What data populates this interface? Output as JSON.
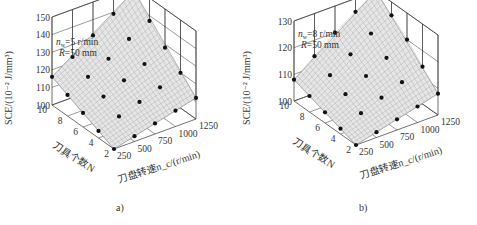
{
  "chart_data": [
    {
      "type": "surface3d",
      "panel_label": "a)",
      "zlabel": "SCE/(10⁻² J/mm³)",
      "xlabel": "刀盘转速n_c/(r/min)",
      "ylabel": "刀具个数N",
      "annotation": [
        "n_w=5 r/min",
        "R=50 mm"
      ],
      "x_ticks": [
        250,
        500,
        750,
        1000,
        1250
      ],
      "y_ticks": [
        2,
        4,
        6,
        8,
        10
      ],
      "z_ticks": [
        100,
        110,
        120,
        130,
        140,
        150
      ],
      "zlim": [
        100,
        150
      ],
      "grid": true,
      "x": [
        250,
        500,
        750,
        1000,
        1250
      ],
      "y": [
        2,
        4,
        6,
        8,
        10
      ],
      "z_surface": [
        [
          100,
          103,
          106,
          109,
          112
        ],
        [
          104,
          108,
          112,
          116,
          120
        ],
        [
          108,
          113,
          118,
          123,
          128
        ],
        [
          112,
          118,
          124,
          131,
          137
        ],
        [
          116,
          123,
          131,
          139,
          148
        ]
      ]
    },
    {
      "type": "surface3d",
      "panel_label": "b)",
      "zlabel": "SCE/(10⁻² J/mm³)",
      "xlabel": "刀盘转速n_c/(r/min)",
      "ylabel": "刀具个数N",
      "annotation": [
        "n_w=8 r/min",
        "R=50 mm"
      ],
      "x_ticks": [
        250,
        500,
        750,
        1000,
        1250
      ],
      "y_ticks": [
        2,
        4,
        6,
        8,
        10
      ],
      "z_ticks": [
        100,
        110,
        120,
        130
      ],
      "zlim": [
        100,
        130
      ],
      "grid": true,
      "x": [
        250,
        500,
        750,
        1000,
        1250
      ],
      "y": [
        2,
        4,
        6,
        8,
        10
      ],
      "z_surface": [
        [
          100,
          102,
          104,
          106,
          108
        ],
        [
          102,
          105,
          108,
          111,
          114
        ],
        [
          104,
          108,
          112,
          116,
          120
        ],
        [
          106,
          111,
          116,
          121,
          125
        ],
        [
          108,
          114,
          120,
          125,
          130
        ]
      ]
    }
  ],
  "panels": [
    {
      "caption": "a)",
      "annotation_line1_pre": "n",
      "annotation_line1_sub": "w",
      "annotation_line1_post": "=5 r/min",
      "annotation_line2_pre": "R",
      "annotation_line2_post": "=50 mm",
      "zlabel": "SCE/(10⁻² J/mm³)",
      "ylabel": "刀具个数N",
      "xlabel": "刀盘转速n_c/(r/min)"
    },
    {
      "caption": "b)",
      "annotation_line1_pre": "n",
      "annotation_line1_sub": "w",
      "annotation_line1_post": "=8 r/min",
      "annotation_line2_pre": "R",
      "annotation_line2_post": "=50 mm",
      "zlabel": "SCE/(10⁻² J/mm³)",
      "ylabel": "刀具个数N",
      "xlabel": "刀盘转速n_c/(r/min)"
    }
  ]
}
